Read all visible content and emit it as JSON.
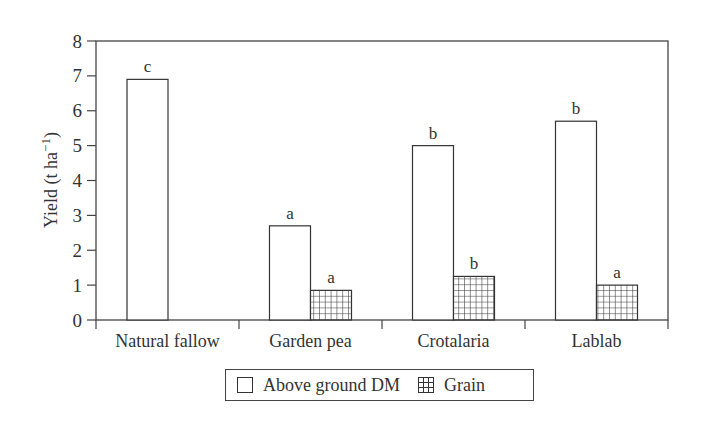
{
  "chart_data": {
    "type": "bar",
    "title": "",
    "xlabel": "",
    "ylabel": "Yield (t ha⁻¹)",
    "ylim": [
      0,
      8
    ],
    "yticks": [
      0,
      1,
      2,
      3,
      4,
      5,
      6,
      7,
      8
    ],
    "grid": false,
    "legend_position": "bottom-center",
    "categories": [
      "Natural fallow",
      "Garden pea",
      "Crotalaria",
      "Lablab"
    ],
    "series": [
      {
        "name": "Above ground DM",
        "pattern": "open",
        "values": [
          6.9,
          2.7,
          5.0,
          5.7
        ],
        "significance_letters": [
          "c",
          "a",
          "b",
          "b"
        ]
      },
      {
        "name": "Grain",
        "pattern": "crosshatch-grid",
        "values": [
          null,
          0.85,
          1.25,
          1.0
        ],
        "significance_letters": [
          null,
          "a",
          "b",
          "a"
        ]
      }
    ]
  },
  "legend": {
    "items": [
      {
        "label": "Above ground DM",
        "swatch": "open"
      },
      {
        "label": "Grain",
        "swatch": "grid"
      }
    ]
  },
  "colors": {
    "axis": "#444444",
    "bar_outline": "#333333",
    "bar_fill": "#ffffff",
    "hatch": "#333333"
  }
}
